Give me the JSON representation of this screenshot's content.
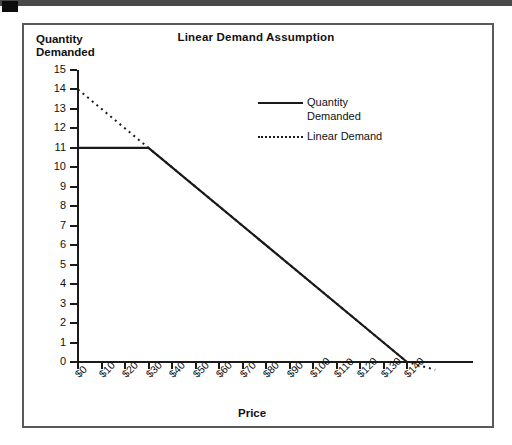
{
  "figure": {
    "title": "Linear Demand Assumption",
    "scan_artifact": "page-scan-top-bar"
  },
  "chart_data": {
    "type": "line",
    "title": "Linear Demand Assumption",
    "xlabel": "Price",
    "ylabel": "Quantity Demanded",
    "xlim": [
      0,
      145
    ],
    "ylim": [
      0,
      15
    ],
    "grid": false,
    "legend_position": "upper-center-right",
    "x_ticks": [
      "$0",
      "$10",
      "$20",
      "$30",
      "$40",
      "$50",
      "$60",
      "$70",
      "$80",
      "$90",
      "$100",
      "$110",
      "$120",
      "$130",
      "$140"
    ],
    "x_tick_values": [
      0,
      10,
      20,
      30,
      40,
      50,
      60,
      70,
      80,
      90,
      100,
      110,
      120,
      130,
      140
    ],
    "y_ticks": [
      "0",
      "1",
      "2",
      "3",
      "4",
      "5",
      "6",
      "7",
      "8",
      "9",
      "10",
      "11",
      "12",
      "13",
      "14",
      "15"
    ],
    "y_tick_values": [
      0,
      1,
      2,
      3,
      4,
      5,
      6,
      7,
      8,
      9,
      10,
      11,
      12,
      13,
      14,
      15
    ],
    "series": [
      {
        "name": "Quantity Demanded",
        "style": "solid",
        "color": "#1a1a1a",
        "points": [
          [
            0,
            11
          ],
          [
            30,
            11
          ],
          [
            140,
            0
          ]
        ]
      },
      {
        "name": "Linear Demand",
        "style": "dotted",
        "color": "#1a1a1a",
        "points": [
          [
            0,
            14
          ],
          [
            30,
            11
          ],
          [
            140,
            0
          ],
          [
            152,
            -0.4
          ]
        ]
      }
    ],
    "legend": [
      {
        "label_line1": "Quantity",
        "label_line2": "Demanded",
        "style": "solid"
      },
      {
        "label_line1": "Linear",
        "label_line2": "Demand",
        "style": "dotted"
      }
    ]
  }
}
